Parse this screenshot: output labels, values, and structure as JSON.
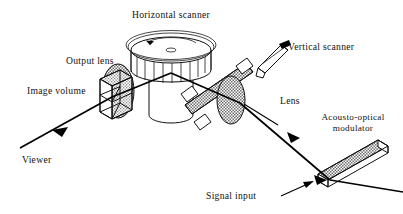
{
  "figure": {
    "title_label": "Horizontal scanner",
    "caption_present": false,
    "background_color": "#ffffff",
    "ink_color": "#111111",
    "shading_color": "#9a9a9a"
  },
  "labels": {
    "horizontal_scanner": "Horizontal scanner",
    "output_lens": "Output lens",
    "image_volume": "Image volume",
    "vertical_scanner": "Vertical scanner",
    "lens": "Lens",
    "acousto_optical_line1": "Acousto-optical",
    "acousto_optical_line2": "modulator",
    "viewer": "Viewer",
    "signal_input": "Signal input"
  },
  "components": [
    {
      "id": "horizontal-scanner",
      "label": "Horizontal scanner",
      "shape": "rotating-polygon-drum",
      "notes": "disc top with centre hub and curved rotation arrow, faceted band, cylindrical base"
    },
    {
      "id": "output-lens",
      "label": "Output lens",
      "shape": "shaded-ellipse"
    },
    {
      "id": "image-volume",
      "label": "Image volume",
      "shape": "wireframe-cube-quadrants"
    },
    {
      "id": "vertical-scanner",
      "label": "Vertical scanner",
      "shape": "small-prism-mirror"
    },
    {
      "id": "lens",
      "label": "Lens",
      "shape": "shaded-ellipse"
    },
    {
      "id": "acousto-optical-modulator",
      "label": "Acousto-optical modulator",
      "shape": "shaded-3d-bar"
    },
    {
      "id": "viewer",
      "label": "Viewer",
      "shape": "beam-terminus-arrow"
    },
    {
      "id": "signal-input",
      "label": "Signal input",
      "shape": "beam-entry-arrow"
    }
  ],
  "beam_path": {
    "description": "Signal input enters the acousto-optical modulator at lower right, travels up-left through the lens and the vertical scanner bar, reflects at the horizontal scanner drum, passes through the image volume and output lens, and exits to the lower left toward the viewer.",
    "arrow_count": 3,
    "arrow_directions": [
      "up-left",
      "up-left",
      "left"
    ]
  }
}
